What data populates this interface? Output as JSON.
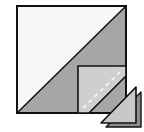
{
  "diagram": {
    "type": "quilt-block-instruction",
    "colors": {
      "background": "#ffffff",
      "light_fabric": "#f7f7f7",
      "dark_fabric": "#a6a6a6",
      "corner_square": "#cfcfcf",
      "trimmed_triangle_front": "#c8c8c8",
      "trimmed_triangle_back": "#8c8c8c",
      "outline": "#111111",
      "stitch_line": "#ffffff"
    },
    "shapes": {
      "block_square": {
        "x": 17,
        "y": 6,
        "size": 109
      },
      "corner_square": {
        "x": 78,
        "y": 66
      },
      "stitch_line": {
        "from": [
          83,
          107
        ],
        "to": [
          121,
          72
        ]
      },
      "trimmed_triangles": 2
    }
  }
}
